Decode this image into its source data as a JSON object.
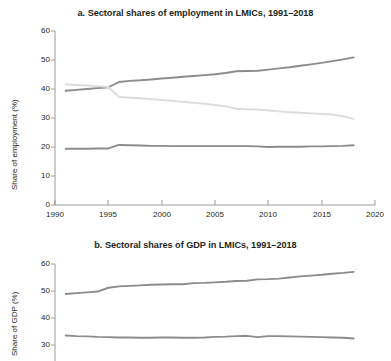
{
  "figure": {
    "background": "#ffffff",
    "line_colors": {
      "services": "#8c8c8c",
      "agriculture": "#dcdcdc",
      "industry": "#8c8c8c"
    }
  },
  "chart_data": [
    {
      "type": "line",
      "panel": "a",
      "title": "a. Sectoral shares of employment in LMICs, 1991–2018",
      "xlabel": "",
      "ylabel": "Share of employment (%)",
      "xlim": [
        1990,
        2020
      ],
      "ylim": [
        0,
        60
      ],
      "xticks": [
        1990,
        1995,
        2000,
        2005,
        2010,
        2015,
        2020
      ],
      "yticks": [
        0,
        10,
        20,
        30,
        40,
        50,
        60
      ],
      "grid": false,
      "legend": "none",
      "x": [
        1991,
        1992,
        1993,
        1994,
        1995,
        1996,
        1997,
        1998,
        1999,
        2000,
        2001,
        2002,
        2003,
        2004,
        2005,
        2006,
        2007,
        2008,
        2009,
        2010,
        2011,
        2012,
        2013,
        2014,
        2015,
        2016,
        2017,
        2018
      ],
      "series": [
        {
          "name": "services",
          "color": "#8c8c8c",
          "values": [
            39.4,
            39.7,
            40.0,
            40.3,
            40.6,
            42.4,
            42.8,
            43.0,
            43.3,
            43.6,
            43.9,
            44.2,
            44.5,
            44.8,
            45.1,
            45.5,
            46.1,
            46.2,
            46.3,
            46.7,
            47.1,
            47.5,
            48.0,
            48.5,
            49.0,
            49.6,
            50.2,
            50.9
          ]
        },
        {
          "name": "agriculture",
          "color": "#dcdcdc",
          "values": [
            41.6,
            41.4,
            41.2,
            41.0,
            40.7,
            37.3,
            37.0,
            36.8,
            36.5,
            36.2,
            35.9,
            35.6,
            35.2,
            34.9,
            34.5,
            34.0,
            33.2,
            33.0,
            32.9,
            32.6,
            32.3,
            32.0,
            31.8,
            31.6,
            31.4,
            31.2,
            30.6,
            29.7
          ]
        },
        {
          "name": "industry",
          "color": "#8c8c8c",
          "values": [
            19.4,
            19.4,
            19.4,
            19.5,
            19.5,
            20.7,
            20.6,
            20.5,
            20.4,
            20.4,
            20.3,
            20.3,
            20.3,
            20.3,
            20.3,
            20.3,
            20.3,
            20.3,
            20.2,
            20.0,
            20.1,
            20.1,
            20.1,
            20.2,
            20.2,
            20.3,
            20.4,
            20.6
          ]
        }
      ]
    },
    {
      "type": "line",
      "panel": "b",
      "title": "b. Sectoral shares of GDP in LMICs, 1991–2018",
      "xlabel": "",
      "ylabel": "Share of GDP (%)",
      "xlim": [
        1990,
        2020
      ],
      "ylim": [
        25,
        60
      ],
      "xticks": [
        1990,
        1995,
        2000,
        2005,
        2010,
        2015,
        2020
      ],
      "yticks": [
        30,
        40,
        50,
        60
      ],
      "grid": false,
      "legend": "none",
      "x": [
        1991,
        1992,
        1993,
        1994,
        1995,
        1996,
        1997,
        1998,
        1999,
        2000,
        2001,
        2002,
        2003,
        2004,
        2005,
        2006,
        2007,
        2008,
        2009,
        2010,
        2011,
        2012,
        2013,
        2014,
        2015,
        2016,
        2017,
        2018
      ],
      "series": [
        {
          "name": "services",
          "color": "#8c8c8c",
          "values": [
            48.9,
            49.2,
            49.5,
            49.8,
            51.2,
            51.7,
            51.9,
            52.1,
            52.3,
            52.4,
            52.5,
            52.5,
            52.9,
            53.0,
            53.2,
            53.4,
            53.7,
            53.8,
            54.3,
            54.4,
            54.6,
            55.0,
            55.4,
            55.7,
            56.0,
            56.4,
            56.7,
            57.1
          ]
        },
        {
          "name": "industry",
          "color": "#8c8c8c",
          "values": [
            33.5,
            33.3,
            33.2,
            33.0,
            32.9,
            32.8,
            32.8,
            32.7,
            32.7,
            32.8,
            32.8,
            32.7,
            32.7,
            32.8,
            33.0,
            33.1,
            33.3,
            33.4,
            32.9,
            33.3,
            33.3,
            33.2,
            33.1,
            33.0,
            32.9,
            32.8,
            32.7,
            32.4
          ]
        }
      ]
    }
  ],
  "panel_a": {
    "title": "a. Sectoral shares of employment in LMICs, 1991–2018",
    "ylabel": "Share of employment (%)",
    "yticks": [
      "60",
      "50",
      "40",
      "30",
      "20",
      "10",
      "0"
    ],
    "xticks": [
      "1990",
      "1995",
      "2000",
      "2005",
      "2010",
      "2015",
      "2020"
    ]
  },
  "panel_b": {
    "title": "b. Sectoral shares of GDP in LMICs, 1991–2018",
    "ylabel": "Share of GDP (%)",
    "yticks": [
      "60",
      "50",
      "40",
      "30"
    ],
    "xticks": []
  }
}
